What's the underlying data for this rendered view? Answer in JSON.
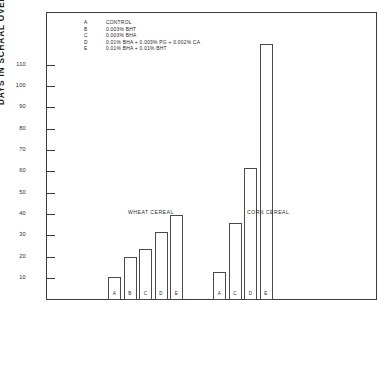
{
  "chart_data": {
    "type": "bar",
    "title": "",
    "subtitle": "",
    "xlabel": "",
    "ylabel": "DAYS IN SCHAAL OVEN AT 145°F.",
    "ylim": [
      0,
      120
    ],
    "yticks": [
      10,
      20,
      30,
      40,
      50,
      60,
      70,
      80,
      90,
      100,
      110
    ],
    "ytick_labels": [
      "10",
      "20",
      "30",
      "40",
      "50",
      "60",
      "70",
      "80",
      "90",
      "100",
      "110"
    ],
    "grid": false,
    "legend_position": "top-left",
    "legend": [
      {
        "key": "A",
        "label": "CONTROL"
      },
      {
        "key": "B",
        "label": "0.003% BHT"
      },
      {
        "key": "C",
        "label": "0.003% BHA"
      },
      {
        "key": "D",
        "label": "0.01% BHA + 0.003% PG + 0.002% CA"
      },
      {
        "key": "E",
        "label": "0.01% BHA + 0.01% BHT"
      }
    ],
    "groups": [
      {
        "name": "WHEAT CEREAL",
        "categories": [
          "A",
          "B",
          "C",
          "D",
          "E"
        ],
        "values": [
          11,
          20,
          24,
          32,
          40
        ]
      },
      {
        "name": "CORN CEREAL",
        "categories": [
          "A",
          "C",
          "D",
          "E"
        ],
        "values": [
          13,
          36,
          62,
          120
        ]
      }
    ]
  }
}
